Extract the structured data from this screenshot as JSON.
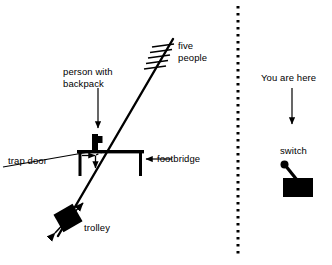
{
  "figure": {
    "stroke_color": "#000000",
    "background_color": "#ffffff",
    "divider": {
      "style": "dotted-vertical",
      "x": 238,
      "y_start": 6,
      "y_end": 258
    }
  },
  "left_panel": {
    "name": "footbridge-scenario",
    "labels": {
      "five_people": "five\npeople",
      "five_people_line1": "five",
      "five_people_line2": "people",
      "person_with_backpack": "person with\nbackpack",
      "person_with_backpack_line1": "person with",
      "person_with_backpack_line2": "backpack",
      "trap_door": "trap door",
      "footbridge": "footbridge",
      "trolley": "trolley"
    },
    "elements": {
      "track": "diagonal rail line",
      "five_people_marks": 5,
      "bridge": "footbridge platform with two legs",
      "person_figure": "person standing on bridge with backpack",
      "trap_door_arrows": "right arrow and down arrow at trap door",
      "trolley_body": "black trolley car on track",
      "trolley_motion_arrow": "double headed arrow along track"
    }
  },
  "right_panel": {
    "name": "observer-scenario",
    "labels": {
      "you_are_here": "You are here",
      "switch": "switch"
    },
    "elements": {
      "you_are_here_arrow": "downward arrow from label to switch",
      "switch_body": "black rectangular switch base",
      "switch_lever": "lever arm with round knob"
    }
  }
}
